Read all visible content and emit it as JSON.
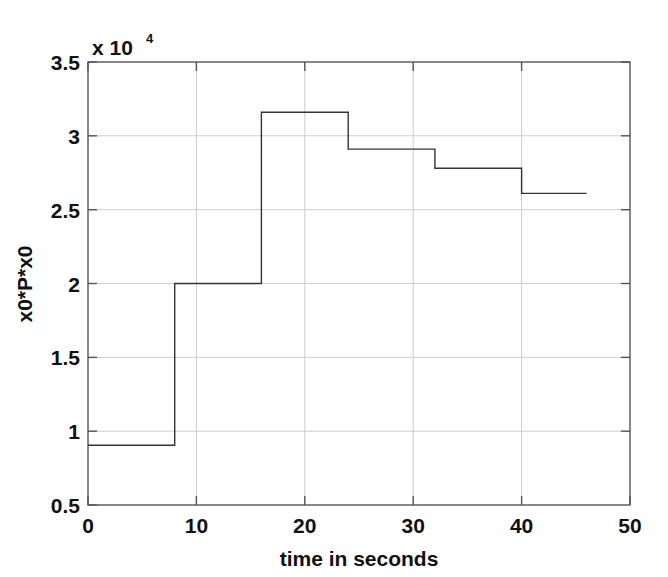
{
  "chart_data": {
    "type": "line",
    "subtype": "staircase",
    "title": "",
    "xlabel": "time in seconds",
    "ylabel": "x0*P*x0",
    "y_exponent_label": "x 10",
    "y_exponent_power": "4",
    "y_scale_factor": 10000,
    "xlim": [
      0,
      50
    ],
    "ylim": [
      0.5,
      3.5
    ],
    "xticks": [
      0,
      10,
      20,
      30,
      40,
      50
    ],
    "xticklabels": [
      "0",
      "10",
      "20",
      "30",
      "40",
      "50"
    ],
    "yticks": [
      0.5,
      1,
      1.5,
      2,
      2.5,
      3,
      3.5
    ],
    "yticklabels": [
      "0.5",
      "1",
      "1.5",
      "2",
      "2.5",
      "3",
      "3.5"
    ],
    "grid": true,
    "grid_x_values": [
      10,
      20,
      30,
      40
    ],
    "grid_y_values": [
      1,
      1.5,
      2,
      2.5,
      3
    ],
    "legend": null,
    "line_color": "#333333",
    "line_width": 1.4,
    "axes_color": "#555555",
    "grid_color": "#cccccc",
    "background": "#ffffff",
    "step_edges": [
      0,
      8,
      16,
      24,
      32,
      40,
      46
    ],
    "values_scaled": [
      0.905,
      2.0,
      3.16,
      2.91,
      2.78,
      2.61
    ],
    "values": [
      9050,
      20000,
      31600,
      29100,
      27800,
      26100
    ],
    "series": [
      {
        "name": "x0*P*x0",
        "x": [
          0,
          8,
          8,
          16,
          16,
          24,
          24,
          32,
          32,
          40,
          40,
          46
        ],
        "y": [
          0.905,
          0.905,
          2.0,
          2.0,
          3.16,
          3.16,
          2.91,
          2.91,
          2.78,
          2.78,
          2.61,
          2.61
        ]
      }
    ]
  }
}
